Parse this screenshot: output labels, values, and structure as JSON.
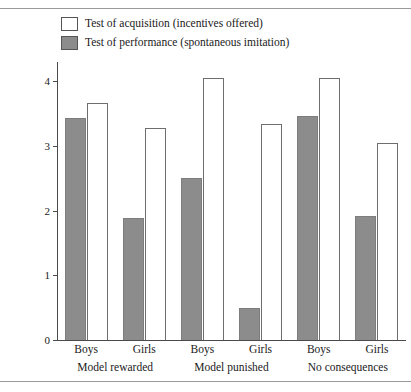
{
  "chart_data": {
    "type": "bar",
    "title": "",
    "xlabel": "",
    "ylabel": "Mean number of different imitative responses reproduced",
    "ylim": [
      0,
      4.3
    ],
    "yticks": [
      0,
      1,
      2,
      3,
      4
    ],
    "ytick_labels": [
      "0",
      "1",
      "2",
      "3",
      "4"
    ],
    "grid": false,
    "legend_position": "top-left",
    "categories": [
      "Boys",
      "Girls",
      "Boys",
      "Girls",
      "Boys",
      "Girls"
    ],
    "groups": [
      {
        "label": "Model rewarded",
        "subcategories": [
          "Boys",
          "Girls"
        ]
      },
      {
        "label": "Model punished",
        "subcategories": [
          "Boys",
          "Girls"
        ]
      },
      {
        "label": "No consequences",
        "subcategories": [
          "Boys",
          "Girls"
        ]
      }
    ],
    "series": [
      {
        "name": "Test of performance (spontaneous imitation)",
        "key": "performance",
        "style": "filled",
        "color": "#8c8c8c",
        "values": [
          3.43,
          1.88,
          2.5,
          0.49,
          3.46,
          1.92
        ]
      },
      {
        "name": "Test of acquisition (incentives offered)",
        "key": "acquisition",
        "style": "open",
        "color": "#ffffff",
        "values": [
          3.66,
          3.28,
          4.05,
          3.34,
          4.05,
          3.04
        ]
      }
    ],
    "bars": [
      {
        "group": "Model rewarded",
        "sex": "Boys",
        "series": "performance",
        "value": 3.43,
        "style": "filled"
      },
      {
        "group": "Model rewarded",
        "sex": "Boys",
        "series": "acquisition",
        "value": 3.66,
        "style": "open"
      },
      {
        "group": "Model rewarded",
        "sex": "Girls",
        "series": "performance",
        "value": 1.88,
        "style": "filled"
      },
      {
        "group": "Model rewarded",
        "sex": "Girls",
        "series": "acquisition",
        "value": 3.28,
        "style": "open"
      },
      {
        "group": "Model punished",
        "sex": "Boys",
        "series": "performance",
        "value": 2.5,
        "style": "filled"
      },
      {
        "group": "Model punished",
        "sex": "Boys",
        "series": "acquisition",
        "value": 4.05,
        "style": "open"
      },
      {
        "group": "Model punished",
        "sex": "Girls",
        "series": "performance",
        "value": 0.49,
        "style": "filled"
      },
      {
        "group": "Model punished",
        "sex": "Girls",
        "series": "acquisition",
        "value": 3.34,
        "style": "open"
      },
      {
        "group": "No consequences",
        "sex": "Boys",
        "series": "performance",
        "value": 3.46,
        "style": "filled"
      },
      {
        "group": "No consequences",
        "sex": "Boys",
        "series": "acquisition",
        "value": 4.05,
        "style": "open"
      },
      {
        "group": "No consequences",
        "sex": "Girls",
        "series": "performance",
        "value": 1.92,
        "style": "filled"
      },
      {
        "group": "No consequences",
        "sex": "Girls",
        "series": "acquisition",
        "value": 3.04,
        "style": "open"
      }
    ]
  },
  "legend": {
    "items": [
      {
        "label": "Test of acquisition (incentives offered)",
        "style": "open"
      },
      {
        "label": "Test of performance (spontaneous imitation)",
        "style": "filled"
      }
    ]
  },
  "colors": {
    "fill_gray": "#8c8c8c",
    "bar_border": "#6e6e6e",
    "axis": "#4a4a4a",
    "rule": "#9a9a9a",
    "background": "#ffffff"
  }
}
